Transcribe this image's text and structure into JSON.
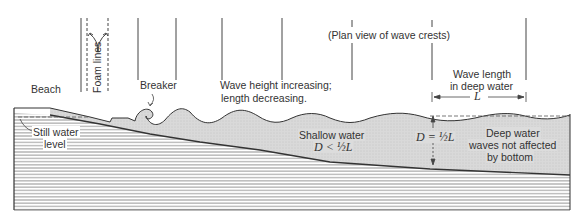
{
  "figure": {
    "labels": {
      "beach": "Beach",
      "foam_lines": "Foam lines",
      "breaker": "Breaker",
      "wave_height_line1": "Wave height increasing;",
      "wave_height_line2": "length decreasing.",
      "plan_view": "(Plan view of wave crests)",
      "wave_length_line1": "Wave length",
      "wave_length_line2": "in deep water",
      "wave_length_symbol": "L",
      "still_water_line1": "Still water",
      "still_water_line2": "level",
      "shallow_line1": "Shallow water",
      "shallow_formula": "D < ½L",
      "depth_formula": "D = ½L",
      "deep_line1": "Deep water",
      "deep_line2": "waves not affected",
      "deep_line3": "by bottom"
    },
    "colors": {
      "water_fill": "#d6d6d6",
      "ink": "#333333",
      "hatch": "#9a9a9a",
      "background": "#ffffff"
    }
  }
}
